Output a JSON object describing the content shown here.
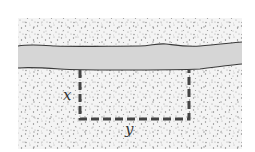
{
  "diagram": {
    "labels": {
      "side": "x",
      "bottom": "y"
    },
    "elements": {
      "land": "stippled ground region",
      "river": "horizontal river band",
      "fence": "dashed three-sided fence"
    },
    "colors": {
      "background": "#ffffff",
      "land_base": "#f2f2f2",
      "stipple": "#8a8a8a",
      "river": "#d6d6d6",
      "river_edge": "#3a3a3a",
      "fence": "#444444"
    }
  }
}
